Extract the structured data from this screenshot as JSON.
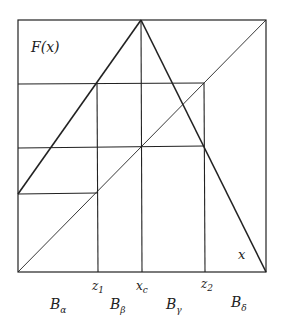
{
  "diagram": {
    "function_label": "F(x)",
    "x_axis_label": "x",
    "ticks": [
      {
        "name": "z",
        "sub": "1"
      },
      {
        "name": "x",
        "sub": "c"
      },
      {
        "name": "z",
        "sub": "2"
      }
    ],
    "regions": [
      {
        "name": "B",
        "sub": "α"
      },
      {
        "name": "B",
        "sub": "β"
      },
      {
        "name": "B",
        "sub": "γ"
      },
      {
        "name": "B",
        "sub": "δ"
      }
    ],
    "line_color": "#222222"
  }
}
